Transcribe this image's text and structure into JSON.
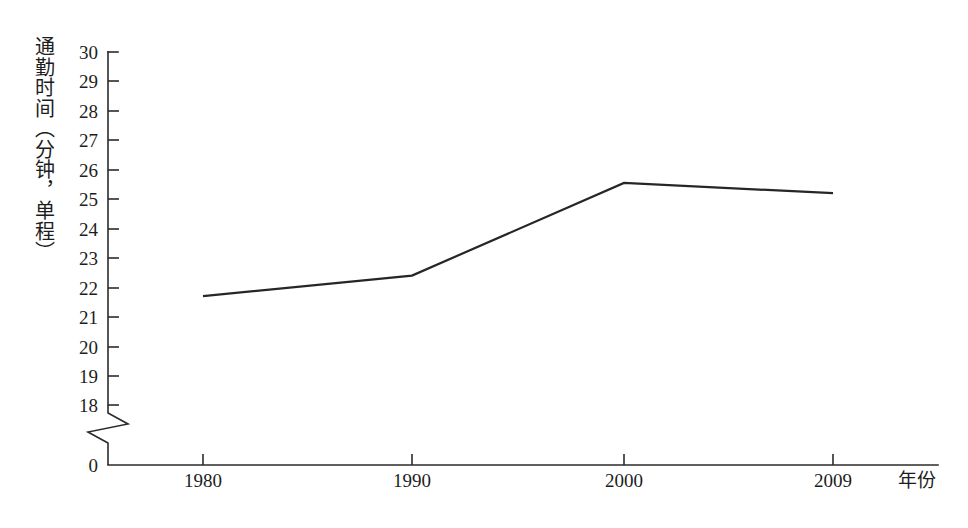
{
  "chart_data": {
    "type": "line",
    "title": "",
    "xlabel": "年份",
    "ylabel": "通勤时间（分钟，单程）",
    "categories": [
      "1980",
      "1990",
      "2000",
      "2009"
    ],
    "x": [
      1980,
      1990,
      2000,
      2009
    ],
    "values": [
      21.7,
      22.4,
      25.55,
      25.2
    ],
    "series": [
      {
        "name": "通勤时间",
        "values": [
          21.7,
          22.4,
          25.55,
          25.2
        ]
      }
    ],
    "ylim": [
      18,
      30
    ],
    "y_axis_break": true,
    "y_axis_break_note": "轴断裂，0 与 18 之间省略",
    "y_ticks": [
      30,
      29,
      28,
      27,
      26,
      25,
      24,
      23,
      22,
      21,
      20,
      19,
      18,
      0
    ],
    "y_tick_labels": [
      "30",
      "29",
      "28",
      "27",
      "26",
      "25",
      "24",
      "23",
      "22",
      "21",
      "20",
      "19",
      "18",
      "0"
    ],
    "x_tick_labels": [
      "1980",
      "1990",
      "2000",
      "2009"
    ],
    "grid": false,
    "legend": false,
    "legend_position": "none",
    "line_color": "#262626",
    "axis_color": "#2b2b2b",
    "background_color": "#ffffff"
  },
  "axes": {
    "y_title": "通勤时间（分钟，单程）",
    "x_title": "年份",
    "zero_label": "0"
  },
  "y_ticks": [
    {
      "label": "30",
      "value": 30
    },
    {
      "label": "29",
      "value": 29
    },
    {
      "label": "28",
      "value": 28
    },
    {
      "label": "27",
      "value": 27
    },
    {
      "label": "26",
      "value": 26
    },
    {
      "label": "25",
      "value": 25
    },
    {
      "label": "24",
      "value": 24
    },
    {
      "label": "23",
      "value": 23
    },
    {
      "label": "22",
      "value": 22
    },
    {
      "label": "21",
      "value": 21
    },
    {
      "label": "20",
      "value": 20
    },
    {
      "label": "19",
      "value": 19
    },
    {
      "label": "18",
      "value": 18
    }
  ],
  "x_ticks": [
    {
      "label": "1980",
      "value": 1980
    },
    {
      "label": "1990",
      "value": 1990
    },
    {
      "label": "2000",
      "value": 2000
    },
    {
      "label": "2009",
      "value": 2009
    }
  ]
}
